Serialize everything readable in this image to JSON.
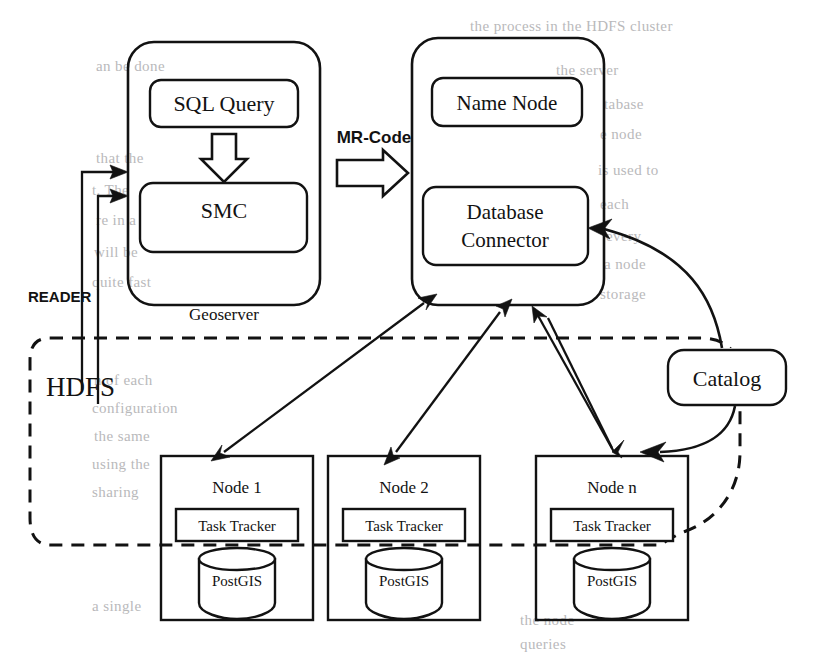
{
  "figure": {
    "type": "system-architecture-diagram",
    "background_color": "#ffffff",
    "line_color": "#121212"
  },
  "geoserver": {
    "container_label": "Geoserver",
    "sql_query": "SQL Query",
    "smc": "SMC",
    "internal_flow_icon": "down-block-arrow-icon"
  },
  "bridge": {
    "label": "MR-Code",
    "icon": "right-block-arrow-icon"
  },
  "master": {
    "name_node": "Name Node",
    "database_connector": "Database\nConnector",
    "database_connector_line1": "Database",
    "database_connector_line2": "Connector"
  },
  "reader": {
    "label": "READER"
  },
  "hdfs": {
    "label": "HDFS"
  },
  "catalog": {
    "label": "Catalog"
  },
  "nodes": [
    {
      "title": "Node 1",
      "task_tracker": "Task Tracker",
      "database": "PostGIS",
      "database_icon": "cylinder-database-icon"
    },
    {
      "title": "Node 2",
      "task_tracker": "Task Tracker",
      "database": "PostGIS",
      "database_icon": "cylinder-database-icon"
    },
    {
      "title": "Node n",
      "task_tracker": "Task Tracker",
      "database": "PostGIS",
      "database_icon": "cylinder-database-icon"
    }
  ],
  "page_bleed": [
    {
      "text": "the process in the HDFS cluster",
      "x": 470,
      "y": 18
    },
    {
      "text": "an be done",
      "x": 96,
      "y": 58
    },
    {
      "text": "the server",
      "x": 556,
      "y": 62
    },
    {
      "text": "tabase",
      "x": 604,
      "y": 96
    },
    {
      "text": "e node",
      "x": 600,
      "y": 126
    },
    {
      "text": "that the",
      "x": 96,
      "y": 150
    },
    {
      "text": "is used to",
      "x": 598,
      "y": 162
    },
    {
      "text": "t. The",
      "x": 92,
      "y": 182
    },
    {
      "text": "each",
      "x": 600,
      "y": 196
    },
    {
      "text": "re in a",
      "x": 96,
      "y": 212
    },
    {
      "text": "every",
      "x": 606,
      "y": 228
    },
    {
      "text": "will be",
      "x": 94,
      "y": 244
    },
    {
      "text": "a node",
      "x": 604,
      "y": 256
    },
    {
      "text": "quite fast",
      "x": 92,
      "y": 274
    },
    {
      "text": "storage",
      "x": 600,
      "y": 286
    },
    {
      "text": "n of each",
      "x": 94,
      "y": 372
    },
    {
      "text": "configuration",
      "x": 92,
      "y": 400
    },
    {
      "text": "the same",
      "x": 94,
      "y": 428
    },
    {
      "text": "using the",
      "x": 92,
      "y": 456
    },
    {
      "text": "sharing",
      "x": 92,
      "y": 484
    },
    {
      "text": "a single",
      "x": 92,
      "y": 598
    },
    {
      "text": "the node",
      "x": 520,
      "y": 612
    },
    {
      "text": "queries",
      "x": 520,
      "y": 636
    }
  ]
}
